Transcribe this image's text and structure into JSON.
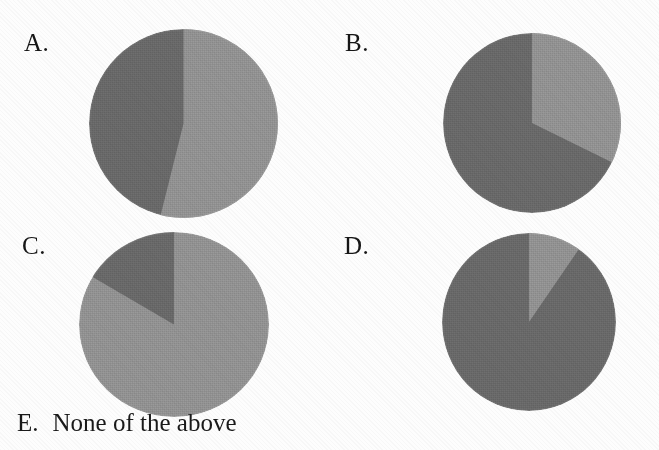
{
  "question": {
    "type": "multiple-choice",
    "options": [
      {
        "id": "A",
        "label": "A."
      },
      {
        "id": "B",
        "label": "B."
      },
      {
        "id": "C",
        "label": "C."
      },
      {
        "id": "D",
        "label": "D."
      },
      {
        "id": "E",
        "label": "E.",
        "text": "None of the above"
      }
    ]
  },
  "colors": {
    "dark_gray": "#6f6f6f",
    "light_gray": "#9a9a9a",
    "mid_gray": "#7d7d7d",
    "paper": "#fdfdfd",
    "ink": "#161616"
  },
  "chart_data": [
    {
      "type": "pie",
      "title": "A.",
      "labels": [
        "Light slice",
        "Dark slice"
      ],
      "values": [
        54,
        46
      ],
      "colors": [
        "#9a9a9a",
        "#6f6f6f"
      ],
      "start_angle_deg": 0,
      "direction": "clockwise",
      "slice_boundaries_deg": [
        0,
        194,
        360
      ],
      "legend": "none",
      "grid": false
    },
    {
      "type": "pie",
      "title": "B.",
      "labels": [
        "Light slice",
        "Dark slice"
      ],
      "values": [
        32,
        68
      ],
      "colors": [
        "#9a9a9a",
        "#6f6f6f"
      ],
      "start_angle_deg": 0,
      "direction": "clockwise",
      "slice_boundaries_deg": [
        0,
        116,
        360
      ],
      "legend": "none",
      "grid": false
    },
    {
      "type": "pie",
      "title": "C.",
      "labels": [
        "Light slice",
        "Dark slice"
      ],
      "values": [
        84,
        16
      ],
      "colors": [
        "#9a9a9a",
        "#6f6f6f"
      ],
      "start_angle_deg": 0,
      "direction": "clockwise",
      "slice_boundaries_deg": [
        0,
        301,
        360
      ],
      "legend": "none",
      "grid": false
    },
    {
      "type": "pie",
      "title": "D.",
      "labels": [
        "Light slice",
        "Dark slice"
      ],
      "values": [
        10,
        90
      ],
      "colors": [
        "#9a9a9a",
        "#6f6f6f"
      ],
      "start_angle_deg": 0,
      "direction": "clockwise",
      "slice_boundaries_deg": [
        0,
        35,
        360
      ],
      "legend": "none",
      "grid": false
    }
  ]
}
